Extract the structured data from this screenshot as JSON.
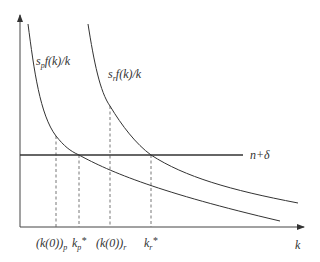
{
  "diagram": {
    "type": "solow-growth-diagram",
    "axes": {
      "x_label": "k",
      "y_label": ""
    },
    "curves": [
      {
        "id": "s_p",
        "label_main": "s",
        "label_sub": "p",
        "label_rest": "f(k)/k"
      },
      {
        "id": "s_r",
        "label_main": "s",
        "label_sub": "r",
        "label_rest": "f(k)/k"
      }
    ],
    "horizontal_line": {
      "label": "n+δ"
    },
    "x_ticks": [
      {
        "id": "k0p",
        "text": "(k(0))",
        "sub": "p"
      },
      {
        "id": "kp_star",
        "text": "k",
        "sub": "p",
        "sup": "*"
      },
      {
        "id": "k0r",
        "text": "(k(0))",
        "sub": "r"
      },
      {
        "id": "kr_star",
        "text": "k",
        "sub": "r",
        "sup": "*"
      }
    ],
    "colors": {
      "line": "#333333",
      "axis": "#444444",
      "dashed": "#666666"
    }
  }
}
